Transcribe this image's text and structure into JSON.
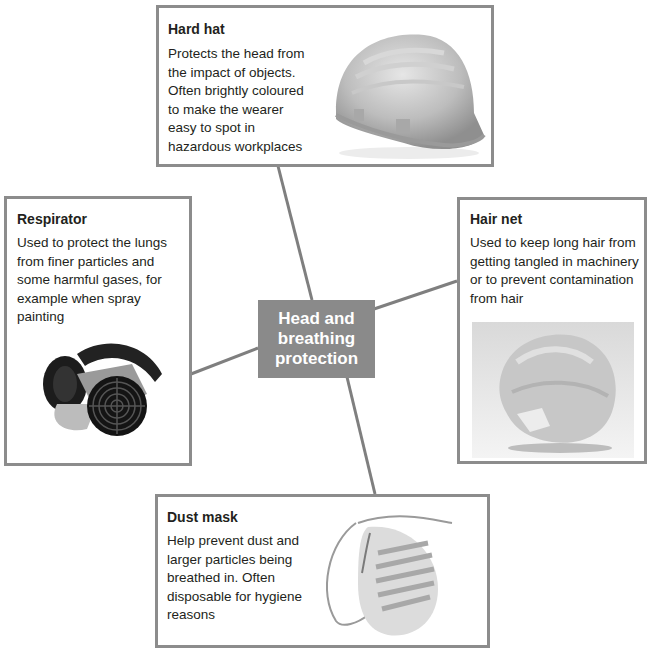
{
  "center": {
    "label": "Head and breathing protection",
    "color": "#8a8a8a"
  },
  "colors": {
    "border": "#8c8c8c",
    "connector": "#7f7f7f",
    "text": "#231f20"
  },
  "items": [
    {
      "id": "hard-hat",
      "title": "Hard hat",
      "description": "Protects the head from the impact of objects. Often brightly coloured to make the wearer easy to spot in hazardous workplaces",
      "image": "hard-hat-photo"
    },
    {
      "id": "respirator",
      "title": "Respirator",
      "description": "Used to protect the lungs from finer particles and some harmful gases, for example when spray painting",
      "image": "respirator-photo"
    },
    {
      "id": "hair-net",
      "title": "Hair net",
      "description": "Used to keep long hair from getting tangled in machinery or to prevent contamination from hair",
      "image": "hair-net-photo"
    },
    {
      "id": "dust-mask",
      "title": "Dust mask",
      "description": "Help prevent dust and larger particles being breathed in. Often disposable for hygiene reasons",
      "image": "dust-mask-photo"
    }
  ]
}
